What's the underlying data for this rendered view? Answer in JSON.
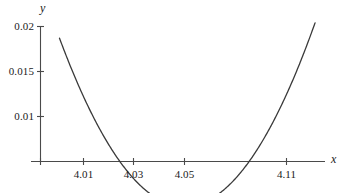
{
  "chart_data": {
    "type": "line",
    "title": "",
    "subtitle": "",
    "xlabel": "x",
    "ylabel": "y",
    "xlim": [
      4.0005,
      4.1175
    ],
    "ylim": [
      0.0,
      0.0205
    ],
    "grid": false,
    "legend": null,
    "annotations": [],
    "x_ticks": [
      {
        "value": 4.01,
        "label": "4.01"
      },
      {
        "value": 4.03,
        "label": "4.03"
      },
      {
        "value": 4.05,
        "label": "4.05"
      },
      {
        "value": 4.11,
        "label": "4.11"
      }
    ],
    "y_ticks": [
      {
        "value": 0.01,
        "label": "0.01"
      },
      {
        "value": 0.015,
        "label": "0.015"
      },
      {
        "value": 0.02,
        "label": "0.02"
      }
    ],
    "series": [
      {
        "name": "curve",
        "color": "#3a3a3a",
        "x": [
          4.0005,
          4.005,
          4.01,
          4.015,
          4.02,
          4.025,
          4.03,
          4.035,
          4.04,
          4.045,
          4.05,
          4.055,
          4.06,
          4.065,
          4.07,
          4.075,
          4.08,
          4.085,
          4.09,
          4.095,
          4.1,
          4.105,
          4.11,
          4.115,
          4.1175
        ],
        "y": [
          0.01645,
          0.01478,
          0.01316,
          0.01161,
          0.01013,
          0.00871,
          0.00736,
          0.00607,
          0.00485,
          0.0037,
          0.00261,
          0.00236,
          0.00285,
          0.00399,
          0.00569,
          0.00789,
          0.01052,
          0.01352,
          0.01685,
          0.02045,
          0.02428,
          0.0283,
          0.03247,
          0.03677,
          0.03896
        ]
      }
    ],
    "minimum": {
      "x": 4.05,
      "y": 0.0
    }
  },
  "axes": {
    "x_axis_label": "x",
    "y_axis_label": "y"
  }
}
